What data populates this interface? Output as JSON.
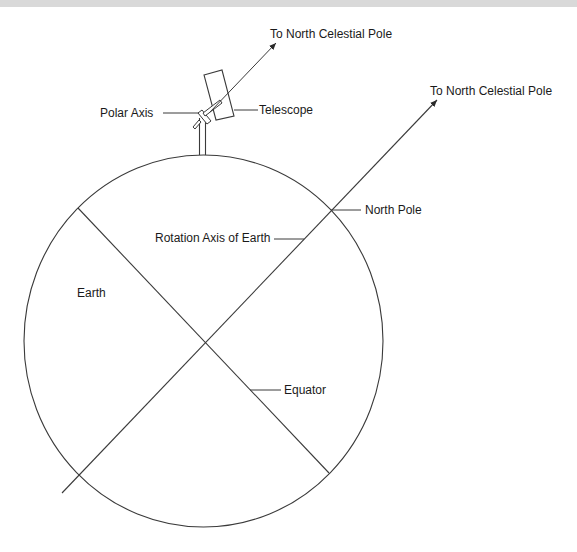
{
  "diagram": {
    "labels": {
      "celestial_pole_top": "To North Celestial Pole",
      "celestial_pole_right": "To North Celestial Pole",
      "polar_axis": "Polar Axis",
      "telescope": "Telescope",
      "north_pole": "North Pole",
      "rotation_axis": "Rotation Axis of Earth",
      "earth": "Earth",
      "equator": "Equator"
    },
    "colors": {
      "line": "#3a3a3a",
      "text": "#1a1a1a",
      "background": "#ffffff",
      "top_band": "#d9d9d9"
    }
  }
}
